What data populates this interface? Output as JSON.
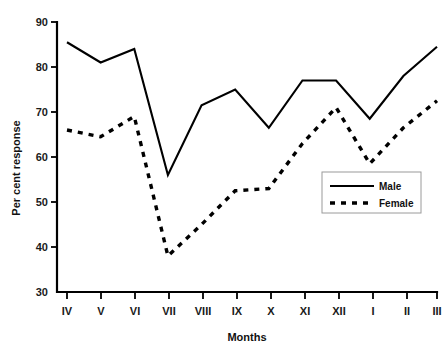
{
  "chart_data": {
    "type": "line",
    "title": "",
    "xlabel": "Months",
    "ylabel": "Per cent response",
    "categories": [
      "IV",
      "V",
      "VI",
      "VII",
      "VIII",
      "IX",
      "X",
      "XI",
      "XII",
      "I",
      "II",
      "III"
    ],
    "series": [
      {
        "name": "Male",
        "style": "solid",
        "color": "#000000",
        "values": [
          85.5,
          81.0,
          84.0,
          56.0,
          71.5,
          75.0,
          66.5,
          77.0,
          77.0,
          68.5,
          78.0,
          84.5
        ]
      },
      {
        "name": "Female",
        "style": "dashed",
        "color": "#000000",
        "values": [
          66.0,
          64.5,
          69.0,
          38.0,
          45.0,
          52.5,
          53.0,
          63.0,
          71.0,
          58.5,
          66.5,
          72.5
        ]
      }
    ],
    "ylim": [
      30,
      90
    ],
    "yticks": [
      30,
      40,
      50,
      60,
      70,
      80,
      90
    ],
    "ytick_labels": [
      "30",
      "40",
      "50",
      "60",
      "70",
      "80",
      "90"
    ],
    "xlim_index": [
      0,
      11
    ],
    "grid": false,
    "legend_position": "lower-right-inside",
    "legend_entries": [
      {
        "label": "Male",
        "style": "solid"
      },
      {
        "label": "Female",
        "style": "dashed"
      }
    ]
  }
}
